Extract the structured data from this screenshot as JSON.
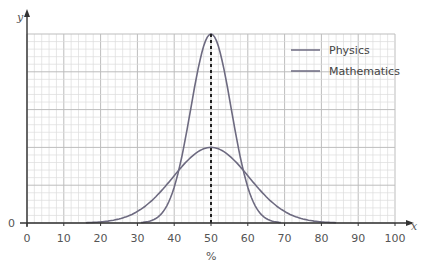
{
  "chart_data": {
    "type": "line",
    "title": "",
    "xlabel": "%",
    "ylabel": "y",
    "x_axis_symbol": "x",
    "xlim": [
      0,
      100
    ],
    "ylim": [
      0,
      5
    ],
    "y_tick_labels": [
      "0"
    ],
    "x_tick_labels": [
      "0",
      "10",
      "20",
      "30",
      "40",
      "50",
      "60",
      "70",
      "80",
      "90",
      "100"
    ],
    "grid": true,
    "legend_position": "upper right",
    "annotations": [
      "dashed vertical line at x = 50 (mean)"
    ],
    "series": [
      {
        "name": "Physics",
        "mean": 50,
        "approx_range": [
          33,
          67
        ],
        "peak_height_major_units": 5,
        "x": [
          33,
          36,
          40,
          44,
          47,
          50,
          53,
          56,
          60,
          64,
          67
        ],
        "values": [
          0.0,
          0.3,
          1.0,
          2.8,
          4.3,
          5.0,
          4.3,
          2.8,
          1.0,
          0.3,
          0.0
        ]
      },
      {
        "name": "Mathematics",
        "mean": 50,
        "approx_range": [
          18,
          82
        ],
        "peak_height_major_units": 2,
        "x": [
          18,
          25,
          30,
          35,
          40,
          45,
          50,
          55,
          60,
          65,
          70,
          75,
          82
        ],
        "values": [
          0.0,
          0.1,
          0.3,
          0.7,
          1.3,
          1.8,
          2.0,
          1.8,
          1.3,
          0.7,
          0.3,
          0.1,
          0.0
        ]
      }
    ]
  },
  "legend": {
    "items": [
      {
        "label": "Physics"
      },
      {
        "label": "Mathematics"
      }
    ]
  },
  "axes": {
    "y_symbol": "y",
    "x_symbol": "x",
    "origin_y_label": "0",
    "x_unit": "%"
  },
  "colors": {
    "curve": "#6d6a80",
    "grid_major": "#bdbdbd",
    "grid_minor": "#dcdcdc",
    "axis": "#333333"
  }
}
